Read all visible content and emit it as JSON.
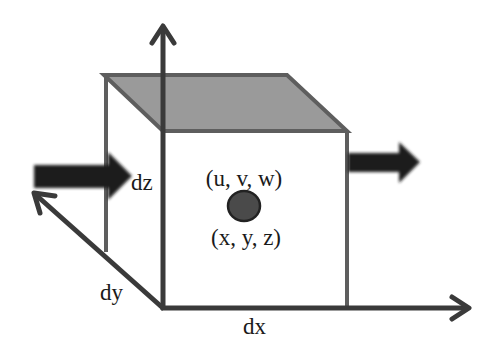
{
  "diagram": {
    "labels": {
      "dz": "dz",
      "dy": "dy",
      "dx": "dx",
      "velocity": "(u, v, w)",
      "position": "(x, y, z)"
    },
    "axes": [
      {
        "name": "z",
        "direction": "up"
      },
      {
        "name": "x",
        "direction": "right"
      },
      {
        "name": "y",
        "direction": "back-left"
      }
    ],
    "arrows": [
      {
        "name": "inflow",
        "side": "left"
      },
      {
        "name": "outflow",
        "side": "right"
      }
    ],
    "colors": {
      "top_face": "#9a9a9a",
      "edges": "#5e5e5e",
      "axes": "#3a3a3a",
      "flow_arrows": "#1c1c1c",
      "point": "#3a3a3a",
      "background": "#ffffff"
    }
  }
}
